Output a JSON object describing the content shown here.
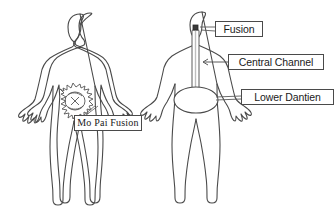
{
  "diagram": {
    "background_color": "#ffffff",
    "outline_color": "#4a4a4a",
    "label_text_color": "#1a1a1a",
    "figures": [
      {
        "id": "left-figure",
        "name": "human-figure-front-left",
        "description": "Front-view human body outline with a spiky circular energy scribble in the lower abdomen",
        "markers": [
          {
            "name": "mo-pai-fusion-scribble",
            "kind": "starburst-scribble",
            "region": "lower-abdomen"
          }
        ]
      },
      {
        "id": "right-figure",
        "name": "human-figure-front-right",
        "description": "Front-view human body outline with a vertical central channel tube from the head to an oval lower dantien",
        "markers": [
          {
            "name": "fusion-point",
            "kind": "small-square-dot",
            "region": "head"
          },
          {
            "name": "central-channel-tube",
            "kind": "vertical-tube",
            "region": "head-to-abdomen"
          },
          {
            "name": "lower-dantien-oval",
            "kind": "oval",
            "region": "lower-abdomen"
          }
        ]
      }
    ],
    "callouts": [
      {
        "id": "mo-pai-fusion",
        "label": "Mo Pai Fusion",
        "font_style": "serif",
        "points_to": "mo-pai-fusion-scribble",
        "leader": "up-left"
      },
      {
        "id": "fusion",
        "label": "Fusion",
        "font_style": "sans",
        "points_to": "fusion-point",
        "leader": "left"
      },
      {
        "id": "central-channel",
        "label": "Central Channel",
        "font_style": "sans",
        "points_to": "central-channel-tube",
        "leader": "left-arrow"
      },
      {
        "id": "lower-dantien",
        "label": "Lower Dantien",
        "font_style": "sans",
        "points_to": "lower-dantien-oval",
        "leader": "left"
      }
    ]
  }
}
